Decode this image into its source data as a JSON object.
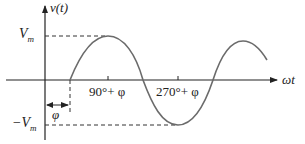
{
  "diagram": {
    "y_axis_label": "v(t)",
    "x_axis_label": "ωt",
    "vmax_label": "V",
    "vmax_sub": "m",
    "vmin_label": "−V",
    "vmin_sub": "m",
    "tick1_label": "90°+ φ",
    "tick2_label": "270°+ φ",
    "phase_label": "φ",
    "colors": {
      "axis": "#222222",
      "curve": "#6b6b6b",
      "dash": "#333333"
    }
  }
}
